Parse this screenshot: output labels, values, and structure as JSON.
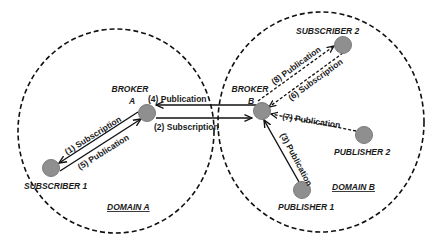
{
  "diagram": {
    "title": "",
    "colors": {
      "node_fill": "#8f8f8f",
      "node_stroke": "#7a7a7a",
      "line": "#111111",
      "domain_border": "#111111",
      "text": "#1a1a1a"
    },
    "domains": [
      {
        "id": "domain_a",
        "label": "DOMAIN A"
      },
      {
        "id": "domain_b",
        "label": "DOMAIN B"
      }
    ],
    "nodes": [
      {
        "id": "broker_a",
        "label_line1": "BROKER",
        "label_line2": "A",
        "domain": "domain_a"
      },
      {
        "id": "broker_b",
        "label_line1": "BROKER",
        "label_line2": "B",
        "domain": "domain_b"
      },
      {
        "id": "subscriber_1",
        "label": "SUBSCRIBER 1",
        "domain": "domain_a"
      },
      {
        "id": "subscriber_2",
        "label": "SUBSCRIBER 2",
        "domain": "domain_b"
      },
      {
        "id": "publisher_1",
        "label": "PUBLISHER 1",
        "domain": "domain_b"
      },
      {
        "id": "publisher_2",
        "label": "PUBLISHER 2",
        "domain": "domain_b"
      }
    ],
    "edges": [
      {
        "step": 1,
        "label": "(1) Subscription",
        "from": "subscriber_1",
        "to": "broker_a",
        "style": "solid"
      },
      {
        "step": 2,
        "label": "(2) Subscription",
        "from": "broker_a",
        "to": "broker_b",
        "style": "solid"
      },
      {
        "step": 3,
        "label": "(3) Publication",
        "from": "publisher_1",
        "to": "broker_b",
        "style": "solid"
      },
      {
        "step": 4,
        "label": "(4) Publication",
        "from": "broker_b",
        "to": "broker_a",
        "style": "solid"
      },
      {
        "step": 5,
        "label": "(5) Publication",
        "from": "broker_a",
        "to": "subscriber_1",
        "style": "solid"
      },
      {
        "step": 6,
        "label": "(6) Subscription",
        "from": "subscriber_2",
        "to": "broker_b",
        "style": "dashed"
      },
      {
        "step": 7,
        "label": "(7) Publication",
        "from": "publisher_2",
        "to": "broker_b",
        "style": "dashed"
      },
      {
        "step": 8,
        "label": "(8) Publication",
        "from": "broker_b",
        "to": "subscriber_2",
        "style": "dashed"
      }
    ]
  }
}
